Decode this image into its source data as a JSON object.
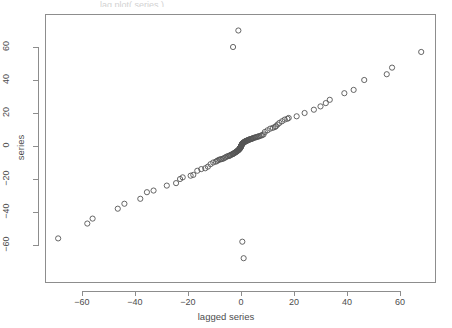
{
  "figure": {
    "background_color": "#ffffff",
    "frame_color": "#8d8d8d",
    "point_color": "#555555",
    "text_color": "#4d4d4d",
    "top_clipped_text": "lag.plot( series )"
  },
  "chart_data": {
    "type": "scatter",
    "title": "",
    "xlabel": "lagged series",
    "ylabel": "series",
    "xlim": [
      -75,
      78
    ],
    "ylim": [
      -74,
      76
    ],
    "xticks": [
      -60,
      -40,
      -20,
      0,
      20,
      40,
      60
    ],
    "yticks": [
      -60,
      -40,
      -20,
      0,
      20,
      40,
      60
    ],
    "xtick_labels": [
      "−60",
      "−40",
      "−20",
      "0",
      "20",
      "40",
      "60"
    ],
    "ytick_labels": [
      "−60",
      "−40",
      "−20",
      "0",
      "20",
      "40",
      "60"
    ],
    "grid": false,
    "legend": null,
    "marker": "open-circle",
    "marker_radius": 2.6,
    "series": [
      {
        "name": "series vs lagged series",
        "x": [
          -69,
          -58,
          -56,
          -46.5,
          -44,
          -38,
          -35.5,
          -33,
          -28,
          -24.5,
          -23,
          -22,
          -19,
          -18,
          -16.5,
          -15,
          -13.5,
          -12.5,
          -11.5,
          -10.5,
          -9.5,
          -9,
          -8.5,
          -8,
          -7.5,
          -7,
          -6.5,
          -6,
          -5.5,
          -5,
          -4.5,
          -4.2,
          -4,
          -3.6,
          -3.2,
          -3,
          -2.8,
          -2.5,
          -2.2,
          -2,
          -1.8,
          -1.6,
          -1.4,
          -1.2,
          -1,
          -0.9,
          -0.8,
          -0.7,
          -0.6,
          -0.5,
          -0.45,
          -0.4,
          -0.35,
          -0.3,
          -0.25,
          -0.2,
          -0.15,
          -0.1,
          -0.05,
          0,
          0.05,
          0.1,
          0.15,
          0.2,
          0.25,
          0.3,
          0.35,
          0.4,
          0.45,
          0.5,
          0.6,
          0.7,
          0.8,
          0.9,
          1,
          1.1,
          1.2,
          1.4,
          1.5,
          1.6,
          1.8,
          2,
          2.2,
          2.4,
          2.6,
          2.8,
          3,
          3.2,
          3.5,
          3.8,
          4,
          4.3,
          4.6,
          5,
          5.4,
          5.8,
          6.2,
          6.6,
          7,
          7.5,
          8,
          8.5,
          9,
          10,
          11,
          12,
          12.8,
          13.2,
          13.8,
          14.5,
          15.5,
          16.5,
          17.5,
          18,
          21,
          24,
          27.5,
          30,
          32,
          33.5,
          39,
          42.5,
          46.5,
          55,
          57,
          68,
          -1,
          -3,
          0.5,
          1
        ],
        "y": [
          -56,
          -47,
          -44,
          -38,
          -35,
          -32,
          -28,
          -27,
          -24,
          -22.5,
          -20,
          -19,
          -18,
          -17.5,
          -15,
          -14,
          -13.5,
          -12.5,
          -11,
          -10,
          -9.5,
          -9,
          -8.5,
          -8.2,
          -8,
          -7.8,
          -7.5,
          -7,
          -6.5,
          -6.2,
          -6,
          -5.8,
          -5.5,
          -5.2,
          -5,
          -4.8,
          -4.5,
          -4.2,
          -4,
          -3.8,
          -3.5,
          -3.2,
          -3,
          -2.8,
          -2.5,
          -2.4,
          -2.2,
          -2,
          -1.8,
          -1.6,
          -1.5,
          -1.4,
          -1.3,
          -1.2,
          -1.1,
          -1,
          -0.8,
          -0.6,
          -0.4,
          -0.2,
          0,
          0.2,
          0.4,
          0.5,
          0.6,
          0.8,
          1,
          1.1,
          1.2,
          1.4,
          1.5,
          1.6,
          1.8,
          2,
          2.1,
          2.2,
          2.4,
          2.5,
          2.6,
          2.8,
          3,
          3.1,
          3.2,
          3.4,
          3.5,
          3.6,
          3.8,
          4,
          4.1,
          4.2,
          4.4,
          4.5,
          4.8,
          5,
          5.2,
          5.4,
          5.6,
          5.8,
          6,
          6.3,
          6.6,
          7,
          8.5,
          9.5,
          10.5,
          11,
          11.5,
          12,
          13,
          14,
          15,
          16,
          16.5,
          17,
          18,
          20,
          22,
          24,
          26,
          28,
          32,
          34,
          40,
          43.5,
          47.5,
          57,
          70,
          60,
          -58,
          -68
        ]
      }
    ]
  }
}
